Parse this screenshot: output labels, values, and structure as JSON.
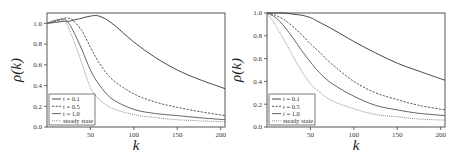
{
  "chart_data": [
    {
      "type": "line",
      "title": "",
      "xlabel": "k",
      "ylabel": "ρ(k)",
      "xlim": [
        0,
        205
      ],
      "ylim": [
        0.0,
        1.1
      ],
      "xticks": [
        50,
        100,
        150,
        200
      ],
      "yticks": [
        0.0,
        0.2,
        0.4,
        0.6,
        0.8,
        1.0
      ],
      "ytick_labels": [
        "0.0",
        "0.2",
        "0.4",
        "0.6",
        "0.8",
        "1.0"
      ],
      "grid": false,
      "legend_position": "lower left",
      "x": [
        0,
        10,
        20,
        25,
        30,
        40,
        50,
        60,
        75,
        100,
        125,
        150,
        175,
        205
      ],
      "series": [
        {
          "name": "t = 0.1",
          "style": "solid",
          "color": "#333333",
          "values": [
            1.0,
            1.01,
            1.02,
            1.02,
            1.03,
            1.05,
            1.07,
            1.07,
            1.0,
            0.82,
            0.67,
            0.55,
            0.46,
            0.37
          ]
        },
        {
          "name": "t = 0.5",
          "style": "dashed",
          "color": "#444444",
          "values": [
            1.0,
            1.02,
            1.05,
            1.05,
            1.03,
            0.93,
            0.77,
            0.62,
            0.46,
            0.32,
            0.24,
            0.19,
            0.15,
            0.11
          ]
        },
        {
          "name": "t = 1.0",
          "style": "solid",
          "color": "#555555",
          "values": [
            1.0,
            1.03,
            1.04,
            1.0,
            0.93,
            0.75,
            0.55,
            0.41,
            0.27,
            0.17,
            0.13,
            0.11,
            0.09,
            0.07
          ]
        },
        {
          "name": "steady state",
          "style": "dotted",
          "color": "#777777",
          "values": [
            1.0,
            1.03,
            1.02,
            0.95,
            0.85,
            0.62,
            0.38,
            0.27,
            0.18,
            0.12,
            0.09,
            0.07,
            0.06,
            0.05
          ]
        }
      ]
    },
    {
      "type": "line",
      "title": "",
      "xlabel": "k",
      "ylabel": "ρ(k)",
      "xlim": [
        0,
        205
      ],
      "ylim": [
        0.0,
        1.0
      ],
      "xticks": [
        50,
        100,
        150,
        200
      ],
      "yticks": [
        0.0,
        0.2,
        0.4,
        0.6,
        0.8,
        1.0
      ],
      "ytick_labels": [
        "0.0",
        "0.2",
        "0.4",
        "0.6",
        "0.8",
        "1.0"
      ],
      "grid": false,
      "legend_position": "lower left",
      "x": [
        0,
        10,
        20,
        30,
        40,
        50,
        60,
        75,
        100,
        125,
        150,
        175,
        205
      ],
      "series": [
        {
          "name": "t = 0.1",
          "style": "solid",
          "color": "#333333",
          "values": [
            1.0,
            1.0,
            1.0,
            0.99,
            0.98,
            0.96,
            0.92,
            0.86,
            0.75,
            0.65,
            0.56,
            0.49,
            0.41
          ]
        },
        {
          "name": "t = 0.5",
          "style": "dashed",
          "color": "#444444",
          "values": [
            1.0,
            0.98,
            0.94,
            0.88,
            0.81,
            0.73,
            0.66,
            0.55,
            0.4,
            0.3,
            0.24,
            0.19,
            0.15
          ]
        },
        {
          "name": "t = 1.0",
          "style": "solid",
          "color": "#555555",
          "values": [
            1.0,
            0.96,
            0.88,
            0.78,
            0.67,
            0.57,
            0.48,
            0.38,
            0.27,
            0.19,
            0.15,
            0.12,
            0.1
          ]
        },
        {
          "name": "steady state",
          "style": "dotted",
          "color": "#777777",
          "values": [
            1.0,
            0.89,
            0.76,
            0.62,
            0.49,
            0.38,
            0.31,
            0.23,
            0.16,
            0.11,
            0.09,
            0.07,
            0.06
          ]
        }
      ]
    }
  ],
  "panels": [
    {
      "xlabel": "k",
      "ylabel": "ρ(k)",
      "legend": [
        "t = 0.1",
        "t = 0.5",
        "t = 1.0",
        "steady state"
      ]
    },
    {
      "xlabel": "k",
      "ylabel": "ρ(k)",
      "legend": [
        "t = 0.1",
        "t = 0.5",
        "t = 1.0",
        "steady state"
      ]
    }
  ]
}
